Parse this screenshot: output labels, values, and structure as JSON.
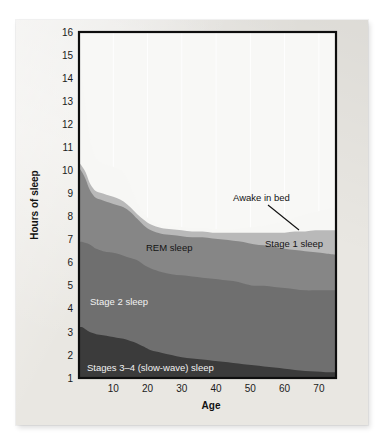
{
  "figure": {
    "kind": "stacked-area-chart",
    "background_color": "#e9e7e2"
  },
  "axes": {
    "y_title": "Hours of sleep",
    "x_title": "Age",
    "y_ticks": [
      "1",
      "2",
      "3",
      "4",
      "5",
      "6",
      "7",
      "8",
      "9",
      "10",
      "11",
      "12",
      "13",
      "14",
      "15",
      "16"
    ],
    "x_ticks": [
      "10",
      "20",
      "30",
      "40",
      "50",
      "60",
      "70"
    ]
  },
  "labels": {
    "awake": "Awake in bed",
    "stage1": "Stage 1 sleep",
    "rem": "REM sleep",
    "stage2": "Stage 2 sleep",
    "sws": "Stages 3–4 (slow-wave) sleep"
  },
  "colors": {
    "awake": "#f7f7f5",
    "stage1": "#b9b9b9",
    "rem": "#868686",
    "stage2": "#6f6f6f",
    "sws": "#3b3b3b",
    "frame": "#0e0e0e",
    "grid": "#ffffff"
  },
  "chart_data": {
    "type": "area",
    "title": "",
    "subtitle": "",
    "xlabel": "Age",
    "ylabel": "Hours of sleep",
    "xlim": [
      0,
      75
    ],
    "ylim": [
      1,
      16
    ],
    "grid": "vertical-only",
    "legend": "in-plot annotations",
    "stacking": "cumulative total = total time in bed",
    "x": [
      0,
      1,
      2,
      3,
      4,
      5,
      7,
      9,
      11,
      13,
      15,
      17,
      19,
      21,
      24,
      27,
      30,
      33,
      36,
      39,
      42,
      45,
      48,
      51,
      54,
      57,
      60,
      63,
      66,
      69,
      72,
      75
    ],
    "series": [
      {
        "name": "Stages 3–4 (slow-wave) sleep",
        "color": "#3b3b3b",
        "values": [
          3.2,
          3.2,
          3.1,
          3.0,
          2.95,
          2.9,
          2.85,
          2.8,
          2.75,
          2.7,
          2.6,
          2.5,
          2.35,
          2.2,
          2.1,
          2.0,
          1.9,
          1.85,
          1.8,
          1.75,
          1.7,
          1.65,
          1.6,
          1.55,
          1.5,
          1.45,
          1.4,
          1.35,
          1.3,
          1.28,
          1.25,
          1.25
        ]
      },
      {
        "name": "Stage 2 sleep",
        "color": "#6f6f6f",
        "values": [
          6.9,
          6.9,
          6.85,
          6.8,
          6.7,
          6.6,
          6.5,
          6.45,
          6.4,
          6.3,
          6.2,
          6.1,
          5.9,
          5.75,
          5.6,
          5.5,
          5.45,
          5.4,
          5.35,
          5.3,
          5.25,
          5.2,
          5.1,
          5.0,
          5.0,
          4.95,
          4.9,
          4.85,
          4.8,
          4.8,
          4.8,
          4.8
        ]
      },
      {
        "name": "REM sleep",
        "color": "#868686",
        "values": [
          10.1,
          9.9,
          9.6,
          9.2,
          8.95,
          8.8,
          8.7,
          8.6,
          8.5,
          8.4,
          8.2,
          7.9,
          7.6,
          7.4,
          7.25,
          7.2,
          7.15,
          7.1,
          7.1,
          7.05,
          7.0,
          6.95,
          6.9,
          6.8,
          6.75,
          6.7,
          6.6,
          6.55,
          6.5,
          6.45,
          6.4,
          6.35
        ]
      },
      {
        "name": "Stage 1 sleep",
        "color": "#b9b9b9",
        "values": [
          10.35,
          10.15,
          9.9,
          9.5,
          9.25,
          9.1,
          9.0,
          8.9,
          8.8,
          8.65,
          8.4,
          8.1,
          7.85,
          7.65,
          7.5,
          7.45,
          7.4,
          7.35,
          7.35,
          7.3,
          7.3,
          7.3,
          7.3,
          7.3,
          7.3,
          7.3,
          7.3,
          7.35,
          7.35,
          7.4,
          7.4,
          7.4
        ]
      },
      {
        "name": "Awake in bed",
        "color": "#f7f7f5",
        "values": [
          15.5,
          14.0,
          12.6,
          11.5,
          10.9,
          10.5,
          10.3,
          10.2,
          10.1,
          9.9,
          9.3,
          8.6,
          8.1,
          7.85,
          7.65,
          7.6,
          7.55,
          7.5,
          7.5,
          7.45,
          7.45,
          7.45,
          7.5,
          7.55,
          7.6,
          7.7,
          7.8,
          7.95,
          8.1,
          8.2,
          8.3,
          8.4
        ]
      }
    ],
    "annotations": [
      {
        "text": "Awake in bed",
        "x": 45,
        "y": 9.4,
        "leader_to_x": 63,
        "leader_to_y": 7.9
      },
      {
        "text": "Stage 1 sleep",
        "x": 56,
        "y": 7.0
      },
      {
        "text": "REM sleep",
        "x": 22,
        "y": 6.7
      },
      {
        "text": "Stage 2 sleep",
        "x": 4,
        "y": 4.3
      },
      {
        "text": "Stages 3–4 (slow-wave) sleep",
        "x": 3,
        "y": 1.7
      }
    ]
  }
}
